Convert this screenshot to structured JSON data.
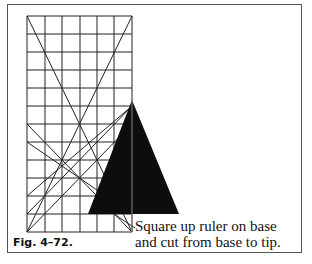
{
  "figure": {
    "label": "Fig. 4–72.",
    "caption_line1": "Square up ruler on base",
    "caption_line2": "and cut from base to tip.",
    "colors": {
      "grid": "#222222",
      "triangle": "#0d0d0d",
      "frame": "#555555",
      "ruler_line": "#888888"
    },
    "grid": {
      "x_lines": [
        27,
        45,
        62,
        80,
        97,
        114,
        132
      ],
      "y_lines": [
        16,
        34,
        52,
        70,
        88,
        106,
        124,
        142,
        160,
        178,
        196,
        214,
        232
      ]
    },
    "diagonals": [
      [
        27,
        16,
        132,
        232
      ],
      [
        132,
        16,
        27,
        232
      ],
      [
        27,
        124,
        132,
        232
      ],
      [
        132,
        106,
        27,
        214
      ],
      [
        132,
        106,
        27,
        196
      ],
      [
        27,
        142,
        132,
        214
      ],
      [
        132,
        124,
        27,
        232
      ]
    ],
    "triangle": {
      "apex": [
        132,
        100
      ],
      "base_left": [
        88,
        214
      ],
      "base_right": [
        179,
        214
      ]
    },
    "ruler_line": [
      132,
      100,
      132,
      232
    ],
    "leader_line": [
      114,
      214,
      135,
      228
    ]
  }
}
